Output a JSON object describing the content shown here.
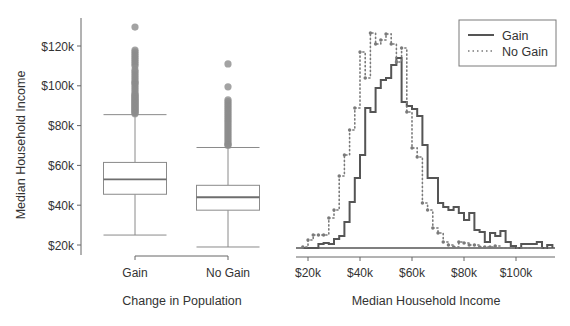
{
  "chart_data": [
    {
      "type": "box",
      "title": "",
      "xlabel": "Change in Population",
      "ylabel": "Median Household Income",
      "yticks": [
        20,
        40,
        60,
        80,
        100,
        120
      ],
      "ytick_labels": [
        "$20k",
        "$40k",
        "$60k",
        "$80k",
        "$100k",
        "$120k"
      ],
      "ylim": [
        17,
        132
      ],
      "categories": [
        "Gain",
        "No Gain"
      ],
      "boxes": [
        {
          "name": "Gain",
          "whisker_low": 25,
          "q1": 45.5,
          "median": 53,
          "q3": 61.5,
          "whisker_high": 85.5,
          "outliers": [
            86,
            86.5,
            87,
            87.5,
            88,
            88.5,
            89,
            89.5,
            90,
            90.5,
            91,
            91.5,
            92,
            92.5,
            93,
            93.5,
            94,
            94.5,
            95,
            95.5,
            96,
            97,
            98,
            99,
            100,
            101,
            101.5,
            102,
            103,
            104,
            105,
            106,
            107,
            108,
            110,
            111,
            112,
            113,
            114,
            115,
            116,
            117,
            118,
            129.5
          ]
        },
        {
          "name": "No Gain",
          "whisker_low": 19,
          "q1": 37.5,
          "median": 44,
          "q3": 50,
          "whisker_high": 69,
          "outliers": [
            70,
            70.5,
            71,
            72,
            73,
            74,
            75,
            76,
            77,
            78,
            79,
            80,
            81,
            82,
            83,
            84,
            85,
            86,
            87,
            88,
            89,
            90,
            91,
            92,
            93,
            99.5,
            111
          ]
        }
      ]
    },
    {
      "type": "histogram",
      "title": "",
      "xlabel": "Median Household Income",
      "ylabel": "",
      "xticks": [
        20,
        40,
        60,
        80,
        100
      ],
      "xtick_labels": [
        "$20k",
        "$40k",
        "$60k",
        "$80k",
        "$100k"
      ],
      "xlim": [
        16,
        116
      ],
      "bin_width": 2,
      "bin_start": 18,
      "legend": {
        "position": "upper right",
        "entries": [
          "Gain",
          "No Gain"
        ]
      },
      "series": [
        {
          "name": "Gain",
          "style": "solid",
          "values": [
            0,
            0,
            0,
            4,
            5,
            4,
            9,
            12,
            26,
            46,
            70,
            93,
            140,
            136,
            160,
            168,
            170,
            183,
            190,
            146,
            142,
            139,
            132,
            103,
            70,
            70,
            45,
            41,
            38,
            41,
            35,
            28,
            35,
            18,
            16,
            6,
            15,
            12,
            17,
            6,
            2,
            0,
            4,
            4,
            4,
            6,
            0,
            3
          ]
        },
        {
          "name": "No Gain",
          "style": "dotted",
          "values": [
            1,
            8,
            13,
            13,
            13,
            30,
            38,
            72,
            93,
            118,
            140,
            196,
            170,
            215,
            204,
            208,
            214,
            204,
            186,
            200,
            136,
            100,
            91,
            45,
            38,
            20,
            15,
            6,
            3,
            1,
            6,
            5,
            3,
            3,
            1,
            1,
            1,
            2,
            0,
            0,
            0,
            0,
            0,
            0,
            0,
            0,
            0,
            0
          ]
        }
      ]
    }
  ],
  "colors": {
    "box_stroke": "#8a8a8a",
    "median_stroke": "#6e6e6e",
    "outlier_fill": "#8c8c8c",
    "axis_stroke": "#666666",
    "gain_line": "#555555",
    "nogain_line": "#7a7a7a",
    "text": "#333333"
  }
}
